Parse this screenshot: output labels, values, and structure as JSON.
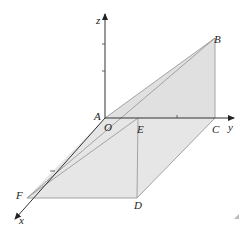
{
  "figure": {
    "type": "3D geometry diagram",
    "axes": {
      "x": "x",
      "y": "y",
      "z": "z"
    },
    "points": {
      "A": "A",
      "O": "O",
      "E": "E",
      "C": "C",
      "B": "B",
      "F": "F",
      "D": "D"
    },
    "colors": {
      "fill": "#e4e4e4",
      "edge": "#9a9a9a",
      "axis": "#333333"
    }
  }
}
